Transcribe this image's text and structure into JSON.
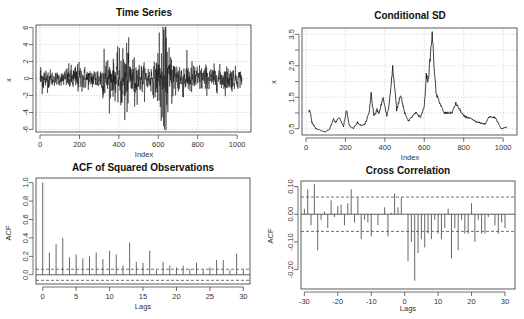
{
  "chart_data": [
    {
      "id": "ts",
      "type": "line",
      "title": "Time Series",
      "xlabel": "Index",
      "ylabel": "x",
      "xlim": [
        0,
        1050
      ],
      "ylim": [
        -6.3,
        6.3
      ],
      "xticks": [
        0,
        200,
        400,
        600,
        800,
        1000
      ],
      "yticks": [
        -6,
        -4,
        -2,
        0,
        2,
        4,
        6
      ],
      "grid": true,
      "n": 1024,
      "volatility_profile": [
        [
          0,
          1.0
        ],
        [
          20,
          0.8
        ],
        [
          60,
          0.45
        ],
        [
          110,
          0.4
        ],
        [
          140,
          0.7
        ],
        [
          200,
          0.9
        ],
        [
          250,
          0.55
        ],
        [
          310,
          0.8
        ],
        [
          330,
          1.4
        ],
        [
          370,
          1.0
        ],
        [
          390,
          1.3
        ],
        [
          430,
          2.2
        ],
        [
          470,
          1.3
        ],
        [
          520,
          0.8
        ],
        [
          580,
          0.9
        ],
        [
          605,
          1.8
        ],
        [
          630,
          3.2
        ],
        [
          660,
          1.6
        ],
        [
          700,
          1.1
        ],
        [
          760,
          1.0
        ],
        [
          820,
          0.8
        ],
        [
          900,
          0.7
        ],
        [
          960,
          0.75
        ],
        [
          1024,
          0.5
        ]
      ],
      "extremes": [
        [
          430,
          -4.9
        ],
        [
          440,
          4.2
        ],
        [
          605,
          5.4
        ],
        [
          615,
          -5.0
        ],
        [
          625,
          4.8
        ],
        [
          632,
          -6.0
        ],
        [
          635,
          6.0
        ],
        [
          325,
          3.5
        ],
        [
          480,
          -3.3
        ]
      ]
    },
    {
      "id": "csd",
      "type": "line",
      "title": "Conditional SD",
      "xlabel": "Index",
      "ylabel": "x",
      "xlim": [
        0,
        1050
      ],
      "ylim": [
        0.3,
        3.7
      ],
      "xticks": [
        0,
        200,
        400,
        600,
        800,
        1000
      ],
      "yticks": [
        0.5,
        1.0,
        1.5,
        2.0,
        2.5,
        3.0,
        3.5
      ],
      "ytick_labels": [
        "0.5",
        "",
        "1.5",
        "",
        "2.5",
        "",
        "3.5"
      ],
      "grid": true,
      "x": [
        10,
        20,
        30,
        50,
        70,
        100,
        120,
        140,
        150,
        170,
        190,
        205,
        220,
        240,
        260,
        280,
        300,
        320,
        330,
        345,
        360,
        370,
        390,
        410,
        420,
        440,
        460,
        480,
        500,
        520,
        540,
        560,
        580,
        600,
        610,
        620,
        640,
        650,
        660,
        680,
        700,
        740,
        760,
        800,
        840,
        870,
        910,
        930,
        960,
        990,
        1020
      ],
      "values": [
        1.0,
        1.1,
        0.7,
        0.5,
        0.45,
        0.4,
        0.5,
        0.8,
        0.7,
        0.85,
        0.55,
        1.1,
        0.6,
        0.5,
        0.7,
        0.6,
        0.65,
        1.0,
        1.6,
        0.9,
        1.1,
        0.95,
        1.5,
        0.9,
        1.2,
        2.45,
        1.1,
        1.6,
        1.0,
        0.75,
        0.9,
        1.0,
        0.85,
        1.2,
        2.2,
        2.0,
        3.5,
        2.5,
        1.6,
        1.3,
        1.0,
        1.0,
        1.3,
        0.9,
        0.8,
        0.7,
        0.65,
        0.9,
        0.85,
        0.5,
        0.55
      ]
    },
    {
      "id": "acf",
      "type": "bar",
      "title": "ACF of Squared Observations",
      "xlabel": "Lags",
      "ylabel": "ACF",
      "xlim": [
        -1,
        31
      ],
      "ylim": [
        -0.1,
        1.05
      ],
      "xticks": [
        0,
        5,
        10,
        15,
        20,
        25,
        30
      ],
      "yticks": [
        0.0,
        0.2,
        0.4,
        0.6,
        0.8,
        1.0
      ],
      "ytick_labels": [
        "0.0",
        "0.2",
        "0.4",
        "0.6",
        "0.8",
        "1.0"
      ],
      "confidence_band": 0.06,
      "lags": [
        0,
        1,
        2,
        3,
        4,
        5,
        6,
        7,
        8,
        9,
        10,
        11,
        12,
        13,
        14,
        15,
        16,
        17,
        18,
        19,
        20,
        21,
        22,
        23,
        24,
        25,
        26,
        27,
        28,
        29,
        30
      ],
      "values": [
        1.0,
        0.24,
        0.33,
        0.4,
        0.19,
        0.22,
        0.18,
        0.2,
        0.24,
        0.17,
        0.26,
        0.22,
        0.1,
        0.35,
        0.14,
        0.13,
        0.26,
        0.05,
        0.14,
        0.1,
        0.08,
        0.1,
        0.06,
        0.13,
        0.05,
        0.08,
        0.16,
        0.16,
        0.05,
        0.23,
        0.05
      ]
    },
    {
      "id": "ccf",
      "type": "bar",
      "title": "Cross Correlation",
      "xlabel": "Lags",
      "ylabel": "ACF",
      "xlim": [
        -31,
        33
      ],
      "ylim": [
        -0.27,
        0.12
      ],
      "xticks": [
        -30,
        -20,
        -10,
        0,
        10,
        20,
        30
      ],
      "yticks": [
        0.1,
        0.0,
        -0.1,
        -0.2
      ],
      "ytick_labels": [
        "0.10",
        "0.00",
        "-0.10",
        "-0.20"
      ],
      "confidence_band": 0.062,
      "lags": [
        -30,
        -29,
        -28,
        -27,
        -26,
        -25,
        -24,
        -23,
        -22,
        -21,
        -20,
        -19,
        -18,
        -17,
        -16,
        -15,
        -14,
        -13,
        -12,
        -11,
        -10,
        -9,
        -8,
        -7,
        -6,
        -5,
        -4,
        -3,
        -2,
        -1,
        0,
        1,
        2,
        3,
        4,
        5,
        6,
        7,
        8,
        9,
        10,
        11,
        12,
        13,
        14,
        15,
        16,
        17,
        18,
        19,
        20,
        21,
        22,
        23,
        24,
        25,
        26,
        27,
        28,
        29,
        30
      ],
      "values": [
        0.02,
        0.09,
        -0.04,
        0.11,
        -0.13,
        -0.02,
        0.01,
        -0.05,
        0.05,
        -0.01,
        0.03,
        0.035,
        -0.04,
        0.04,
        0.09,
        -0.03,
        0.06,
        -0.09,
        -0.02,
        -0.03,
        -0.08,
        0.0,
        -0.04,
        0.0,
        0.025,
        -0.08,
        0.005,
        0.075,
        0.025,
        0.06,
        0.0,
        -0.17,
        -0.1,
        -0.24,
        -0.14,
        -0.09,
        -0.12,
        -0.07,
        -0.09,
        -0.02,
        -0.07,
        -0.09,
        -0.05,
        0.02,
        -0.16,
        -0.05,
        -0.13,
        -0.02,
        -0.07,
        -0.07,
        0.04,
        -0.1,
        -0.02,
        -0.07,
        -0.07,
        -0.01,
        0.0,
        -0.04,
        -0.07,
        -0.03,
        -0.05
      ]
    }
  ],
  "panels": {
    "ts": {
      "title": "Time Series",
      "xlabel": "Index",
      "ylabel": "x"
    },
    "csd": {
      "title": "Conditional SD",
      "xlabel": "Index",
      "ylabel": "x"
    },
    "acf": {
      "title": "ACF of Squared Observations",
      "xlabel": "Lags",
      "ylabel": "ACF"
    },
    "ccf": {
      "title": "Cross Correlation",
      "xlabel": "Lags",
      "ylabel": "ACF"
    }
  },
  "colors": {
    "line": "#111111",
    "bar": "#555555",
    "grid": "#c8c8c8",
    "axis": "#333333",
    "band": "#333333"
  }
}
